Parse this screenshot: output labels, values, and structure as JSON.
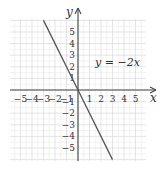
{
  "chart_data": {
    "type": "line",
    "title": "",
    "xlabel": "x",
    "ylabel": "y",
    "equation_label": "y = −2x",
    "xlim": [
      -5.9,
      6.0
    ],
    "ylim": [
      -6.1,
      6.1
    ],
    "grid": true,
    "x_ticks": [
      -5,
      -4,
      -3,
      -2,
      -1,
      1,
      2,
      3,
      4,
      5
    ],
    "y_ticks": [
      5,
      4,
      3,
      2,
      1,
      -1,
      -2,
      -3,
      -4,
      -5
    ],
    "x_tick_labels": [
      "−5",
      "−4",
      "−3",
      "−2",
      "−1",
      "1",
      "2",
      "3",
      "4",
      "5"
    ],
    "y_tick_labels": [
      "5",
      "4",
      "3",
      "2",
      "1",
      "−1",
      "−2",
      "−3",
      "−4",
      "−5"
    ],
    "series": [
      {
        "name": "y = −2x",
        "x": [
          -3,
          0,
          3
        ],
        "y": [
          6,
          0,
          -6
        ]
      }
    ],
    "colors": {
      "grid": "#d8d8d8",
      "axis": "#444444",
      "line": "#555555"
    }
  }
}
